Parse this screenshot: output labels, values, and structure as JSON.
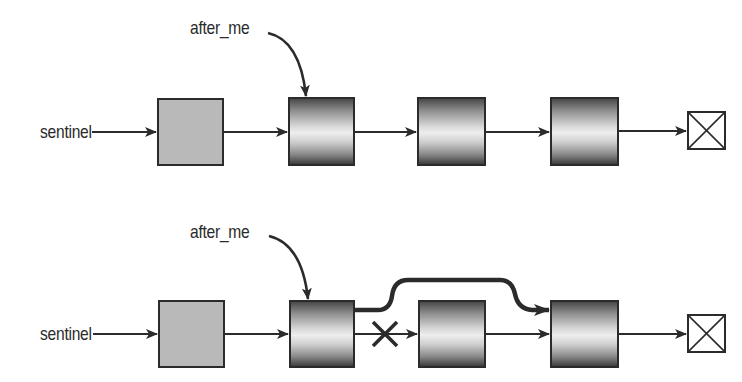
{
  "diagram": {
    "type": "linked-list-insertion",
    "rows": [
      {
        "id": "before",
        "sentinel_label": "sentinel",
        "pointer_label": "after_me",
        "nodes": [
          {
            "style": "sentinel-gray"
          },
          {
            "style": "gradient",
            "pointed_by": "after_me"
          },
          {
            "style": "gradient"
          },
          {
            "style": "gradient"
          }
        ],
        "terminator": "null-box"
      },
      {
        "id": "after",
        "sentinel_label": "sentinel",
        "pointer_label": "after_me",
        "nodes": [
          {
            "style": "sentinel-gray"
          },
          {
            "style": "gradient",
            "pointed_by": "after_me"
          },
          {
            "style": "gradient",
            "removed": true
          },
          {
            "style": "gradient"
          }
        ],
        "bypass_link": {
          "from": 1,
          "to": 3
        },
        "broken_link": {
          "from": 1,
          "to": 2,
          "marker": "X"
        },
        "terminator": "null-box"
      }
    ],
    "colors": {
      "stroke": "#2b2b2b",
      "sentinel_fill": "#b9b9b9",
      "background": "#ffffff"
    }
  }
}
